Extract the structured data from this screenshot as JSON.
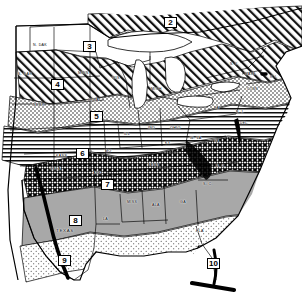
{
  "map": {
    "title": "Plant Hardiness Zone Map of the Eastern and Central United States",
    "frame_color": "#000000",
    "background_color": "#ffffff",
    "zones": [
      {
        "id": "zone-2",
        "label": "2",
        "x": 164,
        "y": 17,
        "pattern": "diagonal-hatch",
        "region": "far north / Canada border"
      },
      {
        "id": "zone-3",
        "label": "3",
        "x": 83,
        "y": 41,
        "pattern": "white",
        "region": "northern plains / Minnesota"
      },
      {
        "id": "zone-4",
        "label": "4",
        "x": 51,
        "y": 79,
        "pattern": "diagonal-hatch",
        "region": "Dakotas / Nebraska / Wisconsin"
      },
      {
        "id": "zone-5",
        "label": "5",
        "x": 90,
        "y": 111,
        "pattern": "fine-stipple",
        "region": "Iowa / Illinois / Michigan"
      },
      {
        "id": "zone-6",
        "label": "6",
        "x": 76,
        "y": 148,
        "pattern": "horizontal-lines",
        "region": "Kansas / Missouri / Ohio Valley"
      },
      {
        "id": "zone-7",
        "label": "7",
        "x": 101,
        "y": 179,
        "pattern": "dense-crosshatch",
        "region": "Oklahoma / Tennessee / Virginia"
      },
      {
        "id": "zone-8",
        "label": "8",
        "x": 69,
        "y": 215,
        "pattern": "solid-gray",
        "region": "Texas / Gulf Coast / Georgia"
      },
      {
        "id": "zone-9",
        "label": "9",
        "x": 58,
        "y": 255,
        "pattern": "light-stipple",
        "region": "south Texas / Gulf shore"
      },
      {
        "id": "zone-10",
        "label": "10",
        "x": 211,
        "y": 258,
        "pattern": "vertical-lines",
        "region": "south Florida"
      }
    ],
    "states": [
      {
        "label": "N. DAK",
        "x": 33,
        "y": 43,
        "size": "normal"
      },
      {
        "label": "S. DAK",
        "x": 18,
        "y": 72,
        "size": "normal"
      },
      {
        "label": "NEBR",
        "x": 33,
        "y": 103,
        "size": "normal"
      },
      {
        "label": "MINN",
        "x": 78,
        "y": 71,
        "size": "normal"
      },
      {
        "label": "WIS",
        "x": 112,
        "y": 76,
        "size": "normal"
      },
      {
        "label": "IOWA",
        "x": 88,
        "y": 98,
        "size": "normal"
      },
      {
        "label": "MICH",
        "x": 151,
        "y": 87,
        "size": "normal"
      },
      {
        "label": "ILL",
        "x": 124,
        "y": 132,
        "size": "normal"
      },
      {
        "label": "IND",
        "x": 148,
        "y": 126,
        "size": "normal"
      },
      {
        "label": "OHIO",
        "x": 170,
        "y": 126,
        "size": "normal"
      },
      {
        "label": "MO",
        "x": 105,
        "y": 149,
        "size": "normal"
      },
      {
        "label": "KANS",
        "x": 56,
        "y": 154,
        "size": "normal"
      },
      {
        "label": "OKLA",
        "x": 50,
        "y": 167,
        "size": "normal"
      },
      {
        "label": "ARK",
        "x": 93,
        "y": 171,
        "size": "normal"
      },
      {
        "label": "KY",
        "x": 165,
        "y": 141,
        "size": "normal"
      },
      {
        "label": "W. VA",
        "x": 190,
        "y": 136,
        "size": "normal"
      },
      {
        "label": "PA",
        "x": 214,
        "y": 106,
        "size": "normal"
      },
      {
        "label": "N. Y.",
        "x": 230,
        "y": 62,
        "size": "tiny"
      },
      {
        "label": "MASS",
        "x": 245,
        "y": 72,
        "size": "tiny"
      },
      {
        "label": "CONN",
        "x": 247,
        "y": 87,
        "size": "tiny"
      },
      {
        "label": "R. I.",
        "x": 270,
        "y": 75,
        "size": "tiny"
      },
      {
        "label": "N. J.",
        "x": 236,
        "y": 110,
        "size": "tiny"
      },
      {
        "label": "DEL.",
        "x": 240,
        "y": 121,
        "size": "tiny"
      },
      {
        "label": "VA",
        "x": 214,
        "y": 139,
        "size": "normal"
      },
      {
        "label": "TENN",
        "x": 148,
        "y": 163,
        "size": "normal"
      },
      {
        "label": "N. C.",
        "x": 216,
        "y": 164,
        "size": "normal"
      },
      {
        "label": "S. C.",
        "x": 203,
        "y": 182,
        "size": "normal"
      },
      {
        "label": "GA",
        "x": 180,
        "y": 200,
        "size": "normal"
      },
      {
        "label": "ALA",
        "x": 152,
        "y": 203,
        "size": "normal"
      },
      {
        "label": "MISS",
        "x": 127,
        "y": 200,
        "size": "normal"
      },
      {
        "label": "LA",
        "x": 103,
        "y": 217,
        "size": "normal"
      },
      {
        "label": "TEXAS",
        "x": 56,
        "y": 229,
        "size": "big"
      },
      {
        "label": "FLA",
        "x": 196,
        "y": 229,
        "size": "normal"
      }
    ]
  }
}
